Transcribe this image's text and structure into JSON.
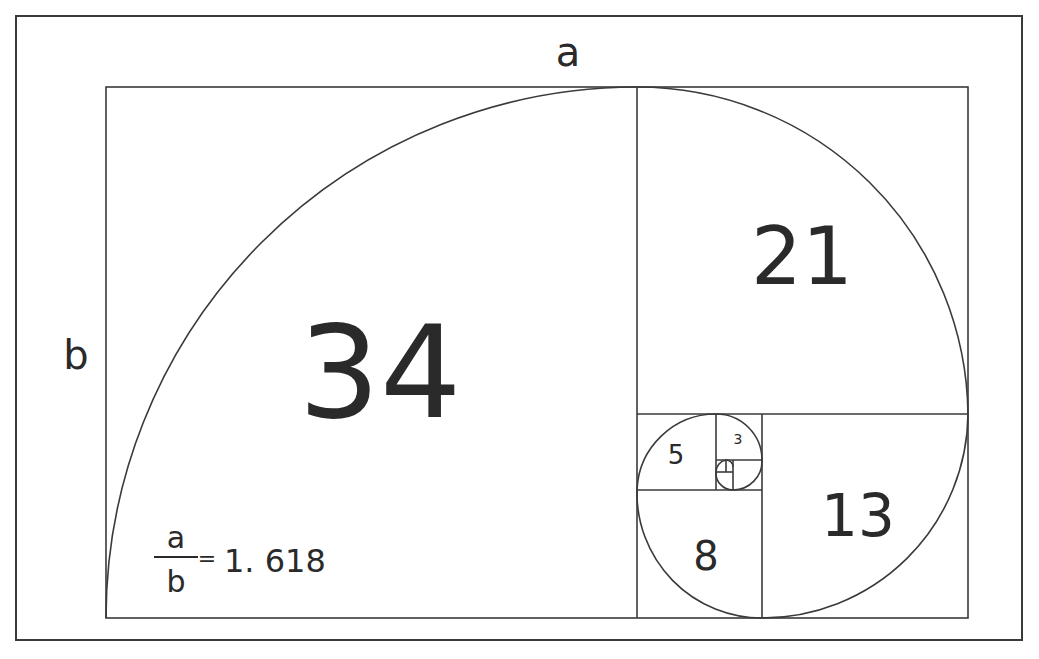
{
  "diagram": {
    "side_labels": {
      "top": "a",
      "left": "b"
    },
    "squares": [
      {
        "value": "34",
        "x": 106,
        "y": 87,
        "size": 531
      },
      {
        "value": "21",
        "x": 637,
        "y": 87,
        "size": 331
      },
      {
        "value": "13",
        "x": 762,
        "y": 414,
        "size": 206
      },
      {
        "value": "8",
        "x": 637,
        "y": 490,
        "size": 125
      },
      {
        "value": "5",
        "x": 637,
        "y": 414,
        "size": 79
      },
      {
        "value": "3",
        "x": 716,
        "y": 414,
        "size": 46
      },
      {
        "value": "2",
        "x": 733,
        "y": 460,
        "size": 29
      },
      {
        "value": "1",
        "x": 716,
        "y": 472,
        "size": 17
      },
      {
        "value": "1",
        "x": 716,
        "y": 460,
        "size": 12
      }
    ],
    "formula": {
      "numerator": "a",
      "denominator": "b",
      "equals": "=",
      "value": "1. 618"
    },
    "colors": {
      "line": "#3a3a3a",
      "text": "#2a2a2a",
      "background": "#ffffff"
    }
  }
}
